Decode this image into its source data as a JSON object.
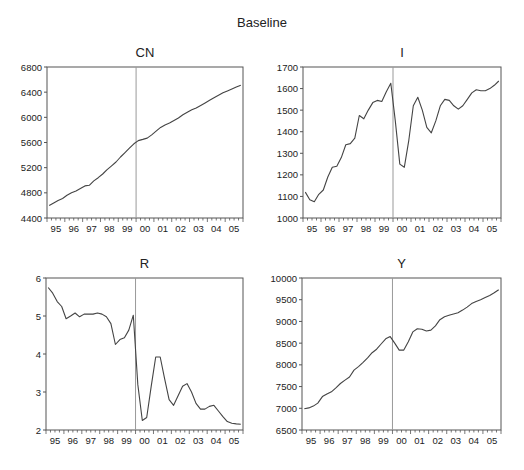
{
  "title": "Baseline",
  "chart_data": [
    {
      "type": "line",
      "title": "CN",
      "xlabel": "",
      "ylabel": "",
      "x_tick_labels": [
        "95",
        "96",
        "97",
        "98",
        "99",
        "00",
        "01",
        "02",
        "03",
        "04",
        "05"
      ],
      "x_start": "1995Q1",
      "x_end": "2005Q4",
      "frequency": "quarterly",
      "vline_at_index": 19.5,
      "ylim": [
        4400,
        6800
      ],
      "yticks": [
        4400,
        4800,
        5200,
        5600,
        6000,
        6400,
        6800
      ],
      "grid": false,
      "values": [
        4600,
        4640,
        4680,
        4710,
        4760,
        4800,
        4830,
        4870,
        4910,
        4920,
        4990,
        5040,
        5100,
        5170,
        5230,
        5290,
        5370,
        5440,
        5510,
        5580,
        5630,
        5650,
        5670,
        5720,
        5780,
        5840,
        5880,
        5910,
        5950,
        5990,
        6040,
        6080,
        6120,
        6150,
        6190,
        6230,
        6270,
        6310,
        6350,
        6390,
        6420,
        6450,
        6480,
        6510
      ]
    },
    {
      "type": "line",
      "title": "I",
      "xlabel": "",
      "ylabel": "",
      "x_tick_labels": [
        "95",
        "96",
        "97",
        "98",
        "99",
        "00",
        "01",
        "02",
        "03",
        "04",
        "05"
      ],
      "x_start": "1995Q1",
      "x_end": "2005Q4",
      "frequency": "quarterly",
      "vline_at_index": 19.5,
      "ylim": [
        1000,
        1700
      ],
      "yticks": [
        1000,
        1100,
        1200,
        1300,
        1400,
        1500,
        1600,
        1700
      ],
      "grid": false,
      "values": [
        1120,
        1085,
        1075,
        1110,
        1130,
        1190,
        1235,
        1240,
        1280,
        1340,
        1345,
        1370,
        1475,
        1460,
        1500,
        1535,
        1545,
        1540,
        1585,
        1625,
        1450,
        1250,
        1235,
        1360,
        1520,
        1560,
        1500,
        1420,
        1395,
        1450,
        1520,
        1550,
        1545,
        1520,
        1505,
        1520,
        1550,
        1580,
        1595,
        1590,
        1590,
        1600,
        1615,
        1635
      ]
    },
    {
      "type": "line",
      "title": "R",
      "xlabel": "",
      "ylabel": "",
      "x_tick_labels": [
        "95",
        "96",
        "97",
        "98",
        "99",
        "00",
        "01",
        "02",
        "03",
        "04",
        "05"
      ],
      "x_start": "1995Q1",
      "x_end": "2005Q4",
      "frequency": "quarterly",
      "vline_at_index": 19.5,
      "ylim": [
        2,
        6
      ],
      "yticks": [
        2,
        3,
        4,
        5,
        6
      ],
      "grid": false,
      "values": [
        5.75,
        5.6,
        5.38,
        5.25,
        4.93,
        5.0,
        5.08,
        4.98,
        5.05,
        5.05,
        5.05,
        5.08,
        5.05,
        4.98,
        4.8,
        4.25,
        4.38,
        4.43,
        4.63,
        5.02,
        3.2,
        2.25,
        2.33,
        3.15,
        3.92,
        3.92,
        3.35,
        2.8,
        2.65,
        2.9,
        3.15,
        3.22,
        3.0,
        2.7,
        2.55,
        2.55,
        2.62,
        2.65,
        2.5,
        2.35,
        2.22,
        2.18,
        2.16,
        2.15
      ]
    },
    {
      "type": "line",
      "title": "Y",
      "xlabel": "",
      "ylabel": "",
      "x_tick_labels": [
        "95",
        "96",
        "97",
        "98",
        "99",
        "00",
        "01",
        "02",
        "03",
        "04",
        "05"
      ],
      "x_start": "1995Q1",
      "x_end": "2005Q4",
      "frequency": "quarterly",
      "vline_at_index": 19.5,
      "ylim": [
        6500,
        10000
      ],
      "yticks": [
        6500,
        7000,
        7500,
        8000,
        8500,
        9000,
        9500,
        10000
      ],
      "grid": false,
      "values": [
        6990,
        7010,
        7050,
        7120,
        7270,
        7330,
        7380,
        7470,
        7570,
        7650,
        7720,
        7880,
        7960,
        8060,
        8160,
        8280,
        8360,
        8480,
        8600,
        8650,
        8500,
        8340,
        8340,
        8530,
        8760,
        8830,
        8820,
        8780,
        8800,
        8900,
        9040,
        9110,
        9140,
        9170,
        9200,
        9260,
        9330,
        9410,
        9460,
        9500,
        9550,
        9600,
        9660,
        9730
      ]
    }
  ]
}
